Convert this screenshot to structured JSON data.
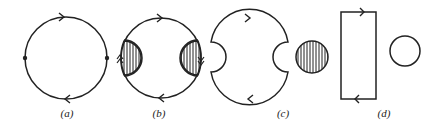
{
  "colors": {
    "stroke": "#222222",
    "background": "#ffffff"
  },
  "panels": [
    {
      "id": "a",
      "label": "(a)",
      "description": "Closed loop with two vertices (dots) on left and right; clockwise arrows top and bottom"
    },
    {
      "id": "b",
      "label": "(b)",
      "description": "Closed loop with hatched half-disc blobs at left and right vertices; double arrows on blob edges"
    },
    {
      "id": "c",
      "label": "(c)",
      "description": "Loop with semicircular notches cut out at left and right, plus a separate hatched disc"
    },
    {
      "id": "d",
      "label": "(d)",
      "description": "Rectangular loop with arrows top and bottom, plus a separate empty circle"
    }
  ]
}
